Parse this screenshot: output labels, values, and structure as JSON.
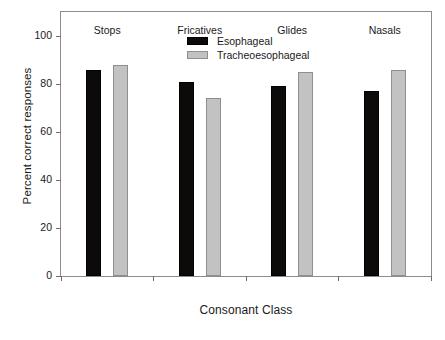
{
  "chart_data": {
    "type": "bar",
    "title": "",
    "xlabel": "Consonant Class",
    "ylabel": "Percent correct responses",
    "categories": [
      "Stops",
      "Fricatives",
      "Glides",
      "Nasals"
    ],
    "series": [
      {
        "name": "Esophageal",
        "color": "#0d0a0a",
        "values": [
          86,
          81,
          79,
          77
        ]
      },
      {
        "name": "Tracheoesophageal",
        "color": "#c2c2c2",
        "values": [
          88,
          74,
          85,
          86
        ]
      }
    ],
    "ylim": [
      0,
      110
    ],
    "yticks": [
      0,
      20,
      40,
      60,
      80,
      100
    ],
    "ytick_labels": [
      "0",
      "20",
      "40",
      "60",
      "80",
      "100"
    ],
    "grid": false,
    "legend_position": "top-center",
    "frame": true
  },
  "legend": {
    "entries": [
      {
        "label": "Esophageal"
      },
      {
        "label": "Tracheoesophageal"
      }
    ]
  }
}
